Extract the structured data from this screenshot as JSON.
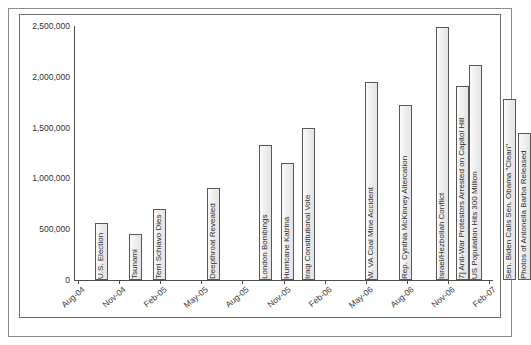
{
  "chart_data": {
    "type": "bar",
    "title": "",
    "subtitle": "",
    "xlabel": "",
    "ylabel": "",
    "ylim": [
      0,
      2500000
    ],
    "grid": false,
    "legend": "none",
    "y_ticks": [
      "0",
      "500,000",
      "1,000,000",
      "1,500,000",
      "2,000,000",
      "2,500,000"
    ],
    "y_tick_values": [
      0,
      500000,
      1000000,
      1500000,
      2000000,
      2500000
    ],
    "x_axis_type": "time",
    "x_tick_labels": [
      "Aug-04",
      "Nov-04",
      "Feb-05",
      "May-05",
      "Aug-05",
      "Nov-05",
      "Feb-06",
      "May-06",
      "Aug-06",
      "Nov-06",
      "Feb-07"
    ],
    "categories": [
      "U.S. Election",
      "Tsunami",
      "Terri Schiavo Dies",
      "Deepthroat Revealed",
      "London Bombings",
      "Hurricane Katrina",
      "Iraqi Constitutional Vote",
      "W. VA Coal Mine Accident",
      "Rep. Cynthia McKinney Altercation",
      "Israel/Hezbollah Conflict",
      "7] Anti-War Protestors Arrested on Capitol Hill",
      "US Population Hits 300 Million",
      "Sen. Biden Calls Sen. Obama \"Clean\"",
      "Photos of Antonella Barba Released"
    ],
    "values": [
      560000,
      455000,
      695000,
      905000,
      1325000,
      1150000,
      1495000,
      1945000,
      1720000,
      2490000,
      1910000,
      2120000,
      1780000,
      1450000
    ],
    "bars": [
      {
        "label": "U.S. Election",
        "value": 560000,
        "x_pct": 5.8
      },
      {
        "label": "Tsunami",
        "value": 455000,
        "x_pct": 14.1
      },
      {
        "label": "Terri Schiavo Dies",
        "value": 695000,
        "x_pct": 19.9
      },
      {
        "label": "Deepthroat Revealed",
        "value": 905000,
        "x_pct": 33.0
      },
      {
        "label": "London Bombings",
        "value": 1325000,
        "x_pct": 45.5
      },
      {
        "label": "Hurricane Katrina",
        "value": 1150000,
        "x_pct": 51.0
      },
      {
        "label": "Iraqi Constitutional Vote",
        "value": 1495000,
        "x_pct": 56.0
      },
      {
        "label": "W. VA Coal Mine Accident",
        "value": 1945000,
        "x_pct": 71.5
      },
      {
        "label": "Rep. Cynthia McKinney Altercation",
        "value": 1720000,
        "x_pct": 79.8
      },
      {
        "label": "Israel/Hezbollah Conflict",
        "value": 2490000,
        "x_pct": 88.8
      },
      {
        "label": "7] Anti-War Protestors Arrested on Capitol Hill",
        "value": 1910000,
        "x_pct": 93.5
      },
      {
        "label": "US Population Hits 300 Million",
        "value": 2120000,
        "x_pct": 96.8
      },
      {
        "label": "Sen. Biden Calls Sen. Obama \"Clean\"",
        "value": 1780000,
        "x_pct": 105.0
      },
      {
        "label": "Photos of Antonella Barba Released",
        "value": 1450000,
        "x_pct": 108.6
      }
    ],
    "colors": {
      "bar_fill": "#efefef",
      "bar_border": "#585858",
      "axis": "#4d4d4d",
      "frame": "#8c8c8c",
      "text": "#2e2e2e",
      "background": "#ffffff"
    }
  }
}
